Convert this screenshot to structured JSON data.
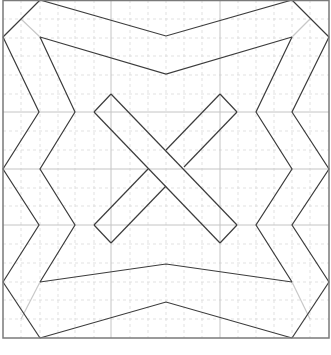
{
  "diagram": {
    "colors": {
      "background": "#ffffff",
      "line": "#3c3c3c",
      "border": "#7a7a7a",
      "grid_major": "#c4c4c4",
      "grid_minor": "#d9d9d9"
    },
    "frame": {
      "x1": 3,
      "y1": 0,
      "x2": 329,
      "y2": 338
    },
    "grid": {
      "major_x": [
        111,
        220
      ],
      "major_y": [
        112,
        169,
        225
      ],
      "minor_x": [
        21,
        40,
        58,
        75,
        94,
        130,
        148,
        166,
        184,
        202,
        238,
        256,
        274,
        292,
        310
      ],
      "minor_y": [
        19,
        38,
        56,
        75,
        94,
        131,
        150,
        188,
        206,
        244,
        263,
        282,
        300,
        319
      ]
    },
    "shapes": [
      {
        "name": "top-outer-zigzag",
        "points": "3,37 40,0"
      },
      {
        "name": "top-chevron-outer",
        "points": "40,0 166,36 292,0"
      },
      {
        "name": "top-chevron-inner",
        "points": "40,37 166,74 292,37"
      },
      {
        "name": "top-right-edge",
        "points": "292,0 329,37"
      },
      {
        "name": "left-zigzag-outer",
        "points": "3,37 39,112 3,169 39,225 3,282"
      },
      {
        "name": "left-zigzag-inner",
        "points": "40,37 75,112 40,169 75,225 40,282"
      },
      {
        "name": "right-zigzag-outer",
        "points": "329,37 292,112 329,169 292,225 329,282"
      },
      {
        "name": "right-zigzag-inner",
        "points": "292,37 256,112 292,169 256,225 292,282"
      },
      {
        "name": "bottom-chevron-outer",
        "points": "40,338 166,302 292,338"
      },
      {
        "name": "bottom-chevron-inner",
        "points": "40,282 166,264 292,282"
      },
      {
        "name": "bottom-left-edge",
        "points": "3,282 40,338"
      },
      {
        "name": "bottom-right-edge",
        "points": "329,282 292,338"
      },
      {
        "name": "center-diamond-outer",
        "points": "166,94 94,112 94,112"
      },
      {
        "name": "diagonal-bar-tl-br",
        "points": "111,94 237,225 220,243 94,112 111,94"
      },
      {
        "name": "diagonal-bar-tr-bl-upper",
        "points": "220,94 237,112 186,165"
      },
      {
        "name": "diagonal-bar-tr-bl-lower",
        "points": "148,187 111,243 94,225 130,169"
      },
      {
        "name": "diagonal-bar-tr-bl-mid",
        "points": "220,94 166,150"
      },
      {
        "name": "top-diamond",
        "points": "94,112 166,94 237,112"
      },
      {
        "name": "bottom-diamond",
        "points": "94,225 166,243 237,225"
      }
    ],
    "faint_segments": [
      {
        "name": "top-left-faint",
        "points": "21,19 40,37"
      },
      {
        "name": "top-right-faint",
        "points": "310,19 292,37"
      },
      {
        "name": "bottom-left-faint",
        "points": "21,319 40,282"
      },
      {
        "name": "bottom-right-faint",
        "points": "310,319 292,282"
      }
    ]
  }
}
